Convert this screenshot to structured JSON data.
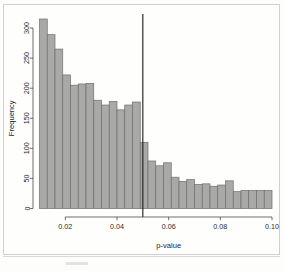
{
  "chart_data": {
    "type": "bar",
    "title": "",
    "xlabel": "p-value",
    "ylabel": "Frequency",
    "xlim": [
      0.01,
      0.1
    ],
    "ylim": [
      0,
      320
    ],
    "xticks": [
      0.02,
      0.04,
      0.06,
      0.08,
      0.1
    ],
    "xtick_labels": [
      "0.02",
      "0.04",
      "0.06",
      "0.08",
      "0.10"
    ],
    "yticks": [
      0,
      50,
      100,
      150,
      200,
      250,
      300
    ],
    "ytick_labels": [
      "0",
      "50",
      "100",
      "150",
      "200",
      "250",
      "300"
    ],
    "grid": false,
    "legend": null,
    "bin_width": 0.003,
    "bin_starts": [
      0.01,
      0.013,
      0.016,
      0.019,
      0.022,
      0.025,
      0.028,
      0.031,
      0.034,
      0.037,
      0.04,
      0.043,
      0.046,
      0.049,
      0.052,
      0.055,
      0.058,
      0.061,
      0.064,
      0.067,
      0.07,
      0.073,
      0.076,
      0.079,
      0.082,
      0.085,
      0.088,
      0.091,
      0.094,
      0.097
    ],
    "categories": [
      "0.010",
      "0.013",
      "0.016",
      "0.019",
      "0.022",
      "0.025",
      "0.028",
      "0.031",
      "0.034",
      "0.037",
      "0.040",
      "0.043",
      "0.046",
      "0.049",
      "0.052",
      "0.055",
      "0.058",
      "0.061",
      "0.064",
      "0.067",
      "0.070",
      "0.073",
      "0.076",
      "0.079",
      "0.082",
      "0.085",
      "0.088",
      "0.091",
      "0.094",
      "0.097"
    ],
    "values": [
      315,
      289,
      265,
      222,
      205,
      207,
      208,
      180,
      172,
      178,
      164,
      172,
      177,
      110,
      79,
      71,
      76,
      52,
      45,
      48,
      40,
      41,
      37,
      39,
      46,
      28,
      30,
      30,
      30,
      30
    ],
    "annotations": [
      {
        "type": "vertical-line",
        "x": 0.05,
        "label": "significance-threshold",
        "color": "#1a1a1a"
      }
    ],
    "bar_fill": "#a9a9a7",
    "bar_stroke": "#6e6e6c"
  },
  "figure": {
    "x_axis_label": "p-value",
    "y_axis_label": "Frequency"
  }
}
